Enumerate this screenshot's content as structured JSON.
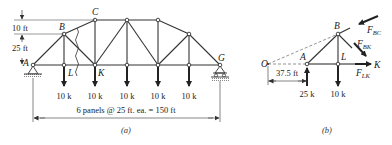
{
  "figure_a": {
    "caption": "(a)",
    "dimensions": {
      "top_rise": "10 ft",
      "vertical_height": "25 ft",
      "span": "6 panels @ 25 ft. ea. = 150 ft"
    },
    "node_labels": {
      "A": "A",
      "B": "B",
      "C": "C",
      "G": "G",
      "K": "K",
      "L": "L"
    },
    "loads": [
      "10 k",
      "10 k",
      "10 k",
      "10 k",
      "10 k"
    ]
  },
  "figure_b": {
    "caption": "(b)",
    "node_labels": {
      "O": "O",
      "A": "A",
      "B": "B",
      "L": "L",
      "K": "K"
    },
    "forces": {
      "F_BC": {
        "main": "F",
        "sub": "BC"
      },
      "F_BK": {
        "main": "F",
        "sub": "BK"
      },
      "F_LK": {
        "main": "F",
        "sub": "LK"
      }
    },
    "dimension": "37.5 ft",
    "reaction": "25 k",
    "load": "10 k"
  },
  "colors": {
    "line": "#333333",
    "dashed": "#666666",
    "background": "#ffffff"
  }
}
